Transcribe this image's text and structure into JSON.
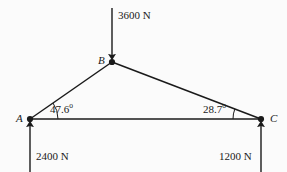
{
  "figure": {
    "background_color": "#fbfbfb",
    "line_color": "#1a1a1a",
    "nodes": [
      {
        "id": "A",
        "label": "A",
        "x": 30,
        "y": 119
      },
      {
        "id": "B",
        "label": "B",
        "x": 112,
        "y": 62
      },
      {
        "id": "C",
        "label": "C",
        "x": 261,
        "y": 119
      }
    ],
    "members": [
      {
        "from": "A",
        "to": "B"
      },
      {
        "from": "B",
        "to": "C"
      },
      {
        "from": "A",
        "to": "C"
      }
    ],
    "forces": [
      {
        "id": "load-b",
        "label": "3600 N",
        "magnitude": 3600,
        "unit": "N",
        "direction": "down",
        "at_node": "B"
      },
      {
        "id": "reaction-a",
        "label": "2400 N",
        "magnitude": 2400,
        "unit": "N",
        "direction": "up",
        "at_node": "A"
      },
      {
        "id": "reaction-c",
        "label": "1200 N",
        "magnitude": 1200,
        "unit": "N",
        "direction": "up",
        "at_node": "C"
      }
    ],
    "angles": [
      {
        "id": "angle-a",
        "value": "47.6",
        "unit": "o",
        "at_node": "A",
        "between": [
          "A-C",
          "A-B"
        ]
      },
      {
        "id": "angle-c",
        "value": "28.7",
        "unit": "o",
        "at_node": "C",
        "between": [
          "C-A",
          "C-B"
        ]
      }
    ]
  }
}
